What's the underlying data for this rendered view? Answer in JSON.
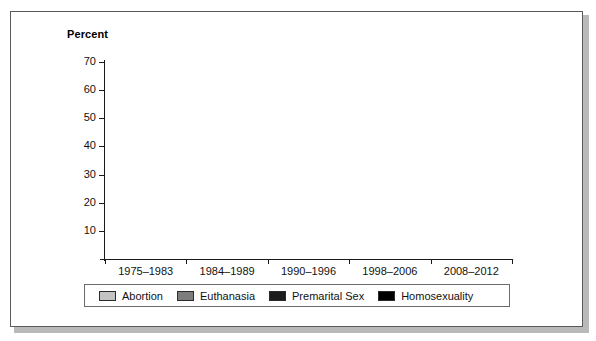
{
  "figure": {
    "title": "Percent",
    "frame_color": "#5a5a5a",
    "background": "#ffffff"
  },
  "chart_data": {
    "type": "bar",
    "title": "Percent",
    "xlabel": "",
    "ylabel": "Percent",
    "ylim": [
      0,
      70
    ],
    "yticks": [
      10,
      20,
      30,
      40,
      50,
      60,
      70
    ],
    "grid": false,
    "legend_position": "bottom",
    "categories": [
      "1975–1983",
      "1984–1989",
      "1990–1996",
      "1998–2006",
      "2008–2012"
    ],
    "series": [
      {
        "name": "Abortion",
        "color": "#c3c3c3",
        "values": [
          29.5,
          32.0,
          33.7,
          49.0,
          63.3
        ]
      },
      {
        "name": "Euthanasia",
        "color": "#7d7d7d",
        "values": [
          31.3,
          21.3,
          26.6,
          41.0,
          53.5
        ]
      },
      {
        "name": "Premarital Sex",
        "color": "#1c1c1c",
        "values": [
          42.5,
          28.0,
          33.5,
          48.3,
          57.0
        ]
      },
      {
        "name": "Homosexuality",
        "color": "#000000",
        "values": [
          56.4,
          47.1,
          44.0,
          55.5,
          67.3
        ]
      }
    ]
  }
}
